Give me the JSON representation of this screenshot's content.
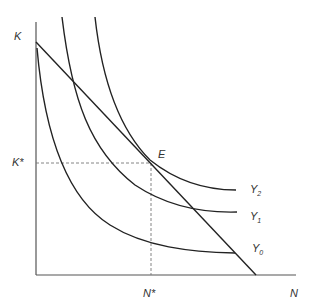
{
  "diagram": {
    "title": "",
    "axes": {
      "y_label": "K",
      "x_label": "N",
      "y_star_label": "K*",
      "x_star_label": "N*"
    },
    "point": {
      "label": "E"
    },
    "curves": [
      {
        "label": "Y",
        "subscript": "2"
      },
      {
        "label": "Y",
        "subscript": "1"
      },
      {
        "label": "Y",
        "subscript": "0"
      }
    ],
    "colors": {
      "line": "#333333",
      "dashed": "#777777",
      "background": "#ffffff"
    }
  }
}
